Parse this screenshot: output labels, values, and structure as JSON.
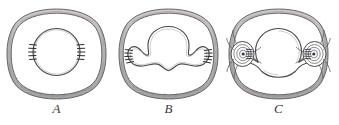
{
  "plate": {
    "background_color": "#ffffff",
    "ink_color": "#4a4a4e",
    "shell_fill_color": "#b9b7b6",
    "hatch_color": "#2f2e32",
    "width": 339,
    "height": 125
  },
  "panels": [
    {
      "id": "a",
      "label": "A",
      "outer_shape": "rounded-square shell",
      "inner_shape": "circle",
      "hatch_groups": 2,
      "hatch_lines_per_group": 5
    },
    {
      "id": "b",
      "label": "B",
      "outer_shape": "rounded-square shell",
      "inner_shape": "three-lobed wavy body",
      "hatch_groups": 2,
      "hatch_lines_per_group": 5
    },
    {
      "id": "c",
      "label": "C",
      "outer_shape": "rounded-square shell",
      "inner_shape": "central circle with two lateral spiral coils",
      "hatch_groups": 2,
      "hatch_lines_per_group": 5
    }
  ]
}
